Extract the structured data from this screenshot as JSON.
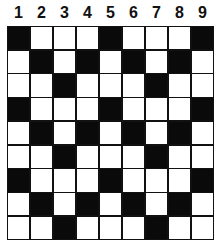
{
  "column_labels": [
    "1",
    "2",
    "3",
    "4",
    "5",
    "6",
    "7",
    "8",
    "9"
  ],
  "colors": {
    "filled": "#0a0a0a",
    "empty": "#ffffff",
    "line": "#111111"
  },
  "grid": {
    "rows": 9,
    "cols": 9,
    "cells": [
      [
        1,
        0,
        0,
        0,
        1,
        0,
        0,
        0,
        1
      ],
      [
        0,
        1,
        0,
        1,
        0,
        1,
        0,
        1,
        0
      ],
      [
        0,
        0,
        1,
        0,
        0,
        0,
        1,
        0,
        0
      ],
      [
        1,
        0,
        0,
        0,
        1,
        0,
        0,
        0,
        1
      ],
      [
        0,
        1,
        0,
        1,
        0,
        1,
        0,
        1,
        0
      ],
      [
        0,
        0,
        1,
        0,
        0,
        0,
        1,
        0,
        0
      ],
      [
        1,
        0,
        0,
        0,
        1,
        0,
        0,
        0,
        1
      ],
      [
        0,
        1,
        0,
        1,
        0,
        1,
        0,
        1,
        0
      ],
      [
        0,
        0,
        1,
        0,
        0,
        0,
        1,
        0,
        0
      ]
    ]
  }
}
